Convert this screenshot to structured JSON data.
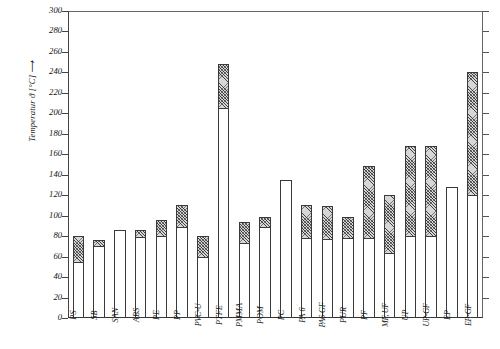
{
  "chart_data": {
    "type": "bar",
    "title": "",
    "xlabel": "",
    "ylabel": "Temperatur ϑ [°C] ⟶",
    "ylim": [
      0,
      300
    ],
    "ytick_step": 20,
    "yticks": [
      0,
      20,
      40,
      60,
      80,
      100,
      120,
      140,
      160,
      180,
      200,
      220,
      240,
      260,
      280,
      300
    ],
    "grid": false,
    "legend_position": "none",
    "stacked": true,
    "series": [
      {
        "name": "Dauergebrauchstemperatur (unten, weiß)",
        "fill": "white"
      },
      {
        "name": "Kurzzeit-/Obergrenze (oben, schraffiert)",
        "fill": "hatched"
      }
    ],
    "categories": [
      "PS",
      "SB",
      "SAN",
      "ABS",
      "PE",
      "PP",
      "PVC-U",
      "PTFE",
      "PMMA",
      "POM",
      "PC",
      "PA 6",
      "PA6-GF",
      "PUR",
      "PF",
      "MF, UF",
      "UP",
      "UP-GF",
      "EP",
      "EP-GF"
    ],
    "bars": [
      {
        "label": "PS",
        "low": 55,
        "high": 80
      },
      {
        "label": "SB",
        "low": 70,
        "high": 76
      },
      {
        "label": "SAN",
        "low": 86,
        "high": 86
      },
      {
        "label": "ABS",
        "low": 79,
        "high": 86
      },
      {
        "label": "PE",
        "low": 80,
        "high": 96
      },
      {
        "label": "PP",
        "low": 89,
        "high": 110
      },
      {
        "label": "PVC-U",
        "low": 60,
        "high": 80
      },
      {
        "label": "PTFE",
        "low": 205,
        "high": 248
      },
      {
        "label": "PMMA",
        "low": 73,
        "high": 94
      },
      {
        "label": "POM",
        "low": 89,
        "high": 99
      },
      {
        "label": "PC",
        "low": 135,
        "high": 135
      },
      {
        "label": "PA 6",
        "low": 78,
        "high": 110
      },
      {
        "label": "PA6-GF",
        "low": 77,
        "high": 109
      },
      {
        "label": "PUR",
        "low": 78,
        "high": 99
      },
      {
        "label": "PF",
        "low": 78,
        "high": 149
      },
      {
        "label": "MF, UF",
        "low": 64,
        "high": 120
      },
      {
        "label": "UP",
        "low": 80,
        "high": 168
      },
      {
        "label": "UP-GF",
        "low": 80,
        "high": 168
      },
      {
        "label": "EP",
        "low": 128,
        "high": 128
      },
      {
        "label": "EP-GF",
        "low": 120,
        "high": 240
      }
    ]
  }
}
